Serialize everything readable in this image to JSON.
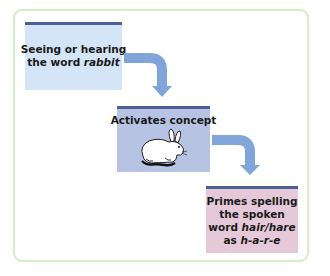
{
  "diagram": {
    "type": "flowchart",
    "colors": {
      "frame_border": "#d6edc8",
      "box_top_stripe": "#4d5f96",
      "arrow": "#80a5d8",
      "step1_fill": "#d3e5f6",
      "step2_fill": "#b7c3e2",
      "step3_fill": "#e6c9d8"
    },
    "steps": [
      {
        "id": "step-1",
        "line1": "Seeing or hearing",
        "line2_plain": "the word ",
        "line2_italic": "rabbit"
      },
      {
        "id": "step-2",
        "label": "Activates concept",
        "image": "rabbit-illustration"
      },
      {
        "id": "step-3",
        "line1": "Primes spelling",
        "line2": "the spoken",
        "line3_plain": "word ",
        "line3_italic": "hair/hare",
        "line4_plain": "as ",
        "line4_italic": "h-a-r-e"
      }
    ],
    "connectors": [
      {
        "from": "step-1",
        "to": "step-2",
        "icon": "curved-arrow-down-icon"
      },
      {
        "from": "step-2",
        "to": "step-3",
        "icon": "curved-arrow-down-icon"
      }
    ]
  }
}
